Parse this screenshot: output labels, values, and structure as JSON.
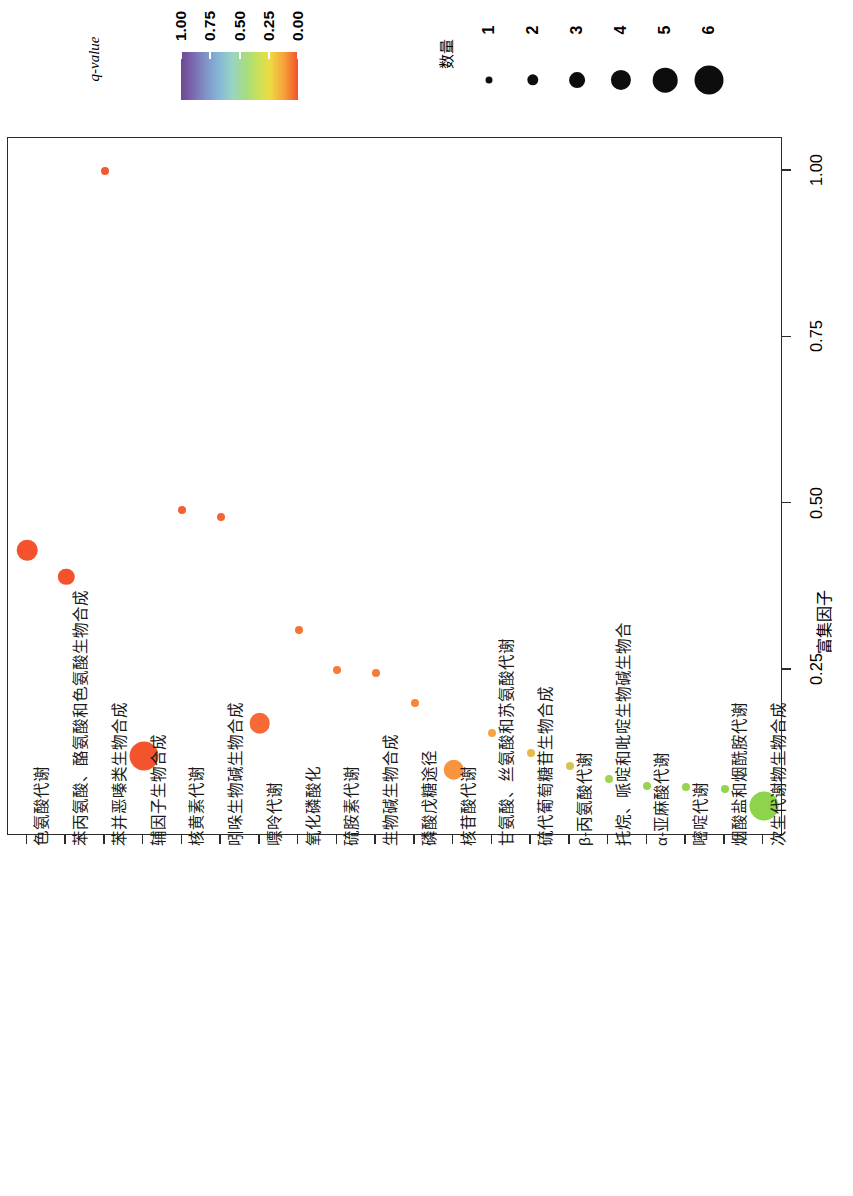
{
  "legends": {
    "color": {
      "title": "q-value",
      "ticks": [
        "1.00",
        "0.75",
        "0.50",
        "0.25",
        "0.00"
      ],
      "gradient_from": "#6b4a8f",
      "gradient_to": "#f4512c"
    },
    "size": {
      "title": "数量",
      "labels": [
        "1",
        "2",
        "3",
        "4",
        "5",
        "6"
      ],
      "dot_color": "#0d0d0d"
    }
  },
  "axes": {
    "value_title": "富集因子",
    "value_ticks": [
      "1.00",
      "0.75",
      "0.50",
      "0.25"
    ],
    "value_min": 0.0,
    "value_max": 1.05
  },
  "chart_data": {
    "type": "scatter",
    "title": "",
    "xlabel": "",
    "ylabel": "富集因子",
    "xlim": [
      0,
      21
    ],
    "ylim": [
      0,
      1.05
    ],
    "grid": false,
    "legend_position": "top",
    "orientation": "category-axis-horizontal, value-axis-vertical (figure rotated 90°)",
    "size_legend_title": "数量",
    "color_legend_title": "q-value",
    "categories": [
      "色氨酸代谢",
      "苯丙氨酸、酪氨酸和色氨酸生物合成",
      "苯并恶嗪类生物合成",
      "辅因子生物合成",
      "核黄素代谢",
      "吲哚生物碱生物合成",
      "嘌呤代谢",
      "氧化磷酸化",
      "硫胺素代谢",
      "生物碱生物合成",
      "磷酸戊糖途径",
      "核苷酸代谢",
      "甘氨酸、丝氨酸和苏氨酸代谢",
      "硫代葡萄糖苷生物合成",
      "β-丙氨酸代谢",
      "托烷、哌啶和吡啶生物碱生物合",
      "α-亚麻酸代谢",
      "嘧啶代谢",
      "烟酸盐和烟酰胺代谢",
      "次生代谢物生物合成"
    ],
    "points": [
      {
        "category": "色氨酸代谢",
        "enrichment_factor": 0.43,
        "count": 4,
        "q_value": 0.03,
        "color": "#f4512c"
      },
      {
        "category": "苯丙氨酸、酪氨酸和色氨酸生物合成",
        "enrichment_factor": 0.39,
        "count": 3,
        "q_value": 0.04,
        "color": "#f4512c"
      },
      {
        "category": "苯并恶嗪类生物合成",
        "enrichment_factor": 1.0,
        "count": 1,
        "q_value": 0.06,
        "color": "#f4582e"
      },
      {
        "category": "辅因子生物合成",
        "enrichment_factor": 0.12,
        "count": 6,
        "q_value": 0.05,
        "color": "#f4542d"
      },
      {
        "category": "核黄素代谢",
        "enrichment_factor": 0.49,
        "count": 1,
        "q_value": 0.07,
        "color": "#f55f31"
      },
      {
        "category": "吲哚生物碱生物合成",
        "enrichment_factor": 0.48,
        "count": 1,
        "q_value": 0.08,
        "color": "#f56433"
      },
      {
        "category": "嘌呤代谢",
        "enrichment_factor": 0.17,
        "count": 4,
        "q_value": 0.09,
        "color": "#f56a35"
      },
      {
        "category": "氧化磷酸化",
        "enrichment_factor": 0.31,
        "count": 1,
        "q_value": 0.11,
        "color": "#f67336"
      },
      {
        "category": "硫胺素代谢",
        "enrichment_factor": 0.25,
        "count": 1,
        "q_value": 0.12,
        "color": "#f77b38"
      },
      {
        "category": "生物碱生物合成",
        "enrichment_factor": 0.245,
        "count": 1,
        "q_value": 0.12,
        "color": "#f77b38"
      },
      {
        "category": "磷酸戊糖途径",
        "enrichment_factor": 0.2,
        "count": 1,
        "q_value": 0.13,
        "color": "#f7853a"
      },
      {
        "category": "核苷酸代谢",
        "enrichment_factor": 0.1,
        "count": 4,
        "q_value": 0.15,
        "color": "#f8943d"
      },
      {
        "category": "甘氨酸、丝氨酸和苏氨酸代谢",
        "enrichment_factor": 0.155,
        "count": 1,
        "q_value": 0.16,
        "color": "#f9a33f"
      },
      {
        "category": "硫代葡萄糖苷生物合成",
        "enrichment_factor": 0.125,
        "count": 1,
        "q_value": 0.19,
        "color": "#e8b84a"
      },
      {
        "category": "β-丙氨酸代谢",
        "enrichment_factor": 0.105,
        "count": 1,
        "q_value": 0.22,
        "color": "#d8c24f"
      },
      {
        "category": "托烷、哌啶和吡啶生物碱生物合",
        "enrichment_factor": 0.085,
        "count": 1,
        "q_value": 0.28,
        "color": "#9fd452"
      },
      {
        "category": "α-亚麻酸代谢",
        "enrichment_factor": 0.075,
        "count": 1,
        "q_value": 0.3,
        "color": "#97d450"
      },
      {
        "category": "嘧啶代谢",
        "enrichment_factor": 0.073,
        "count": 1,
        "q_value": 0.3,
        "color": "#95d44f"
      },
      {
        "category": "烟酸盐和烟酰胺代谢",
        "enrichment_factor": 0.07,
        "count": 1,
        "q_value": 0.31,
        "color": "#93d44e"
      },
      {
        "category": "次生代谢物生物合成",
        "enrichment_factor": 0.045,
        "count": 6,
        "q_value": 0.33,
        "color": "#8ed34c"
      }
    ]
  }
}
